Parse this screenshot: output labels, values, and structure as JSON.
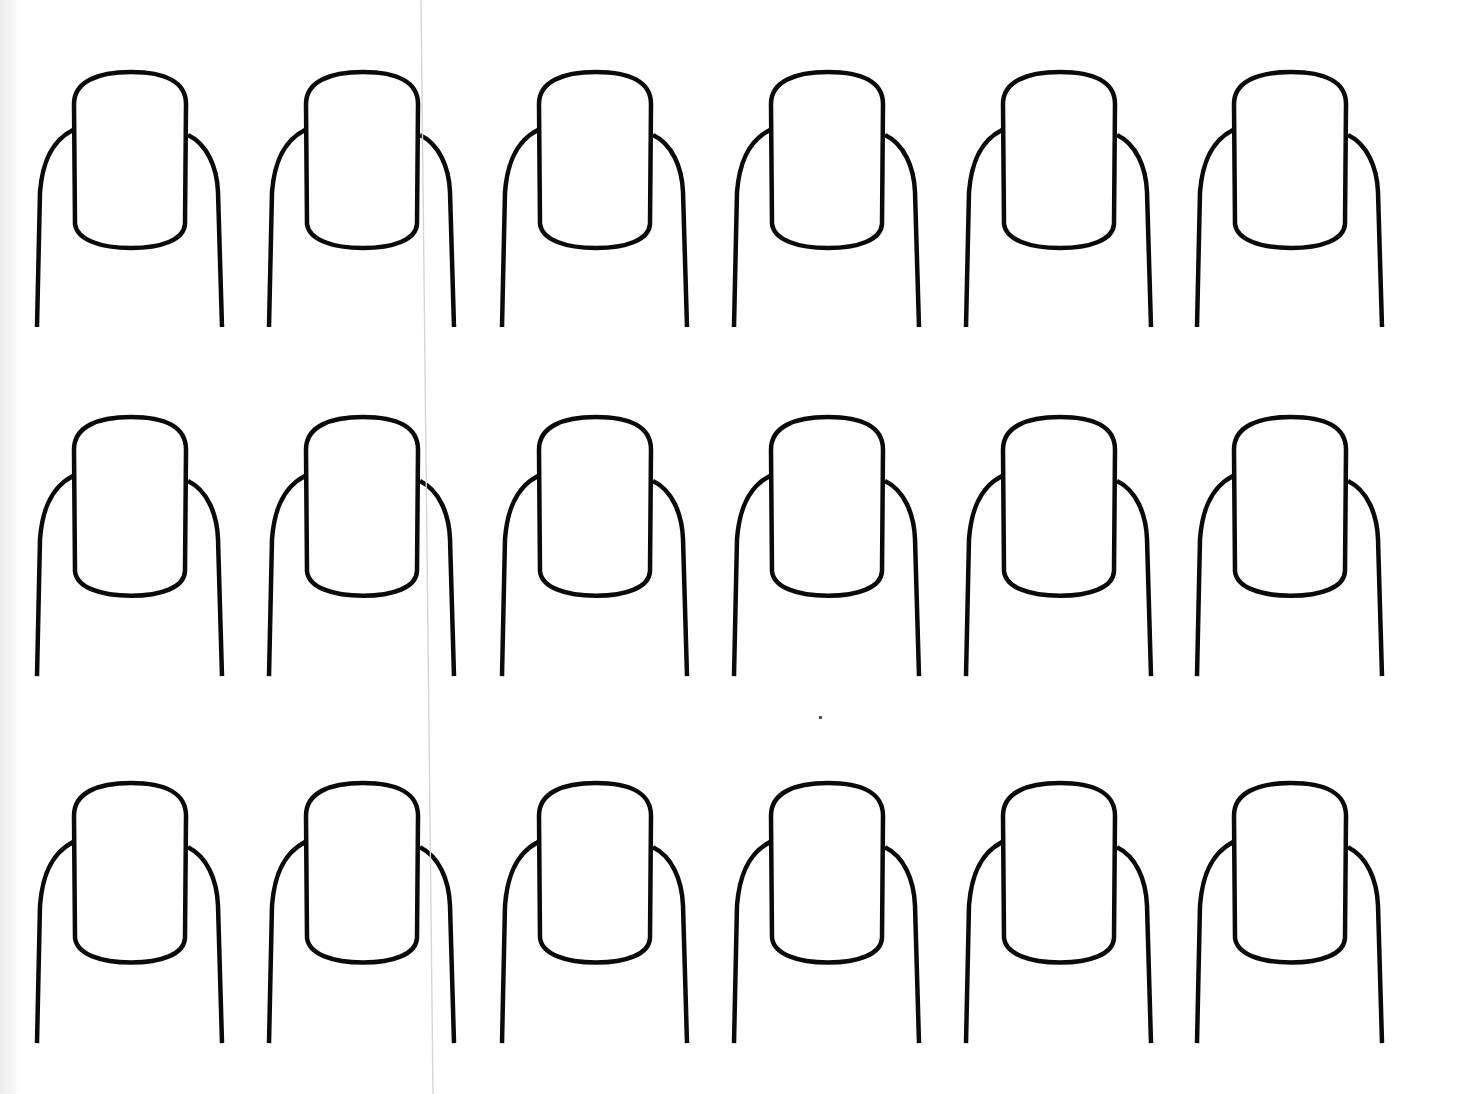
{
  "page": {
    "type": "nail art practice template",
    "background": "#ffffff",
    "line_color": "#0a0a0a",
    "fold_line_color": "#d4d4d4"
  },
  "grid": {
    "rows": 3,
    "columns": 6,
    "total_nails": 18,
    "column_x": [
      37,
      269,
      502,
      734,
      966,
      1197
    ],
    "row_top_y": [
      72,
      417,
      783
    ],
    "row_scale_y": [
      1.0,
      1.016,
      1.02
    ]
  },
  "nails": [
    {
      "row": 1,
      "col": 1
    },
    {
      "row": 1,
      "col": 2
    },
    {
      "row": 1,
      "col": 3
    },
    {
      "row": 1,
      "col": 4
    },
    {
      "row": 1,
      "col": 5
    },
    {
      "row": 1,
      "col": 6
    },
    {
      "row": 2,
      "col": 1
    },
    {
      "row": 2,
      "col": 2
    },
    {
      "row": 2,
      "col": 3
    },
    {
      "row": 2,
      "col": 4
    },
    {
      "row": 2,
      "col": 5
    },
    {
      "row": 2,
      "col": 6
    },
    {
      "row": 3,
      "col": 1
    },
    {
      "row": 3,
      "col": 2
    },
    {
      "row": 3,
      "col": 3
    },
    {
      "row": 3,
      "col": 4
    },
    {
      "row": 3,
      "col": 5
    },
    {
      "row": 3,
      "col": 6
    }
  ],
  "artifacts": {
    "fold_line": {
      "x_top": 421,
      "x_bottom": 433
    },
    "speck": {
      "x": 820,
      "y": 717
    }
  }
}
